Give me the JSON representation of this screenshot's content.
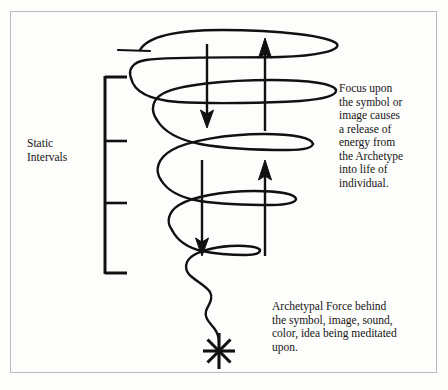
{
  "figure": {
    "kind": "hand-drawn-diagram",
    "background_color": "#fdfdfc",
    "ink_color": "#111111",
    "border_color": "#b9b9b9"
  },
  "labels": {
    "static_intervals": "Static\nIntervals",
    "focus_text": "Focus upon\nthe symbol or\nimage causes\na release of\nenergy from\nthe Archetype\ninto life of\nindividual.",
    "archetypal_line1": "Archetypal Force behind",
    "archetypal_line2": "the symbol, image, sound,",
    "archetypal_line3": "color, idea being meditated",
    "archetypal_line4": "upon."
  },
  "icons": {
    "starburst": "starburst-icon",
    "arrow_down_upper": "arrow-down-icon",
    "arrow_up_upper": "arrow-up-icon",
    "arrow_down_lower": "arrow-down-icon",
    "arrow_up_lower": "arrow-up-icon",
    "bracket": "interval-bracket-icon",
    "spiral": "spiral-vortex-icon"
  },
  "bracket": {
    "ticks": 4,
    "tick_y_values": [
      76,
      141,
      203,
      274
    ],
    "x": 104,
    "tick_length": 22
  },
  "arrows": [
    {
      "name": "arrow-down-upper",
      "x": 207,
      "y_top": 44,
      "y_bottom": 126,
      "direction": "down"
    },
    {
      "name": "arrow-up-upper",
      "x": 265,
      "y_top": 39,
      "y_bottom": 131,
      "direction": "up"
    },
    {
      "name": "arrow-down-lower",
      "x": 202,
      "y_top": 160,
      "y_bottom": 254,
      "direction": "down"
    },
    {
      "name": "arrow-up-lower",
      "x": 265,
      "y_top": 160,
      "y_bottom": 256,
      "direction": "up"
    }
  ]
}
